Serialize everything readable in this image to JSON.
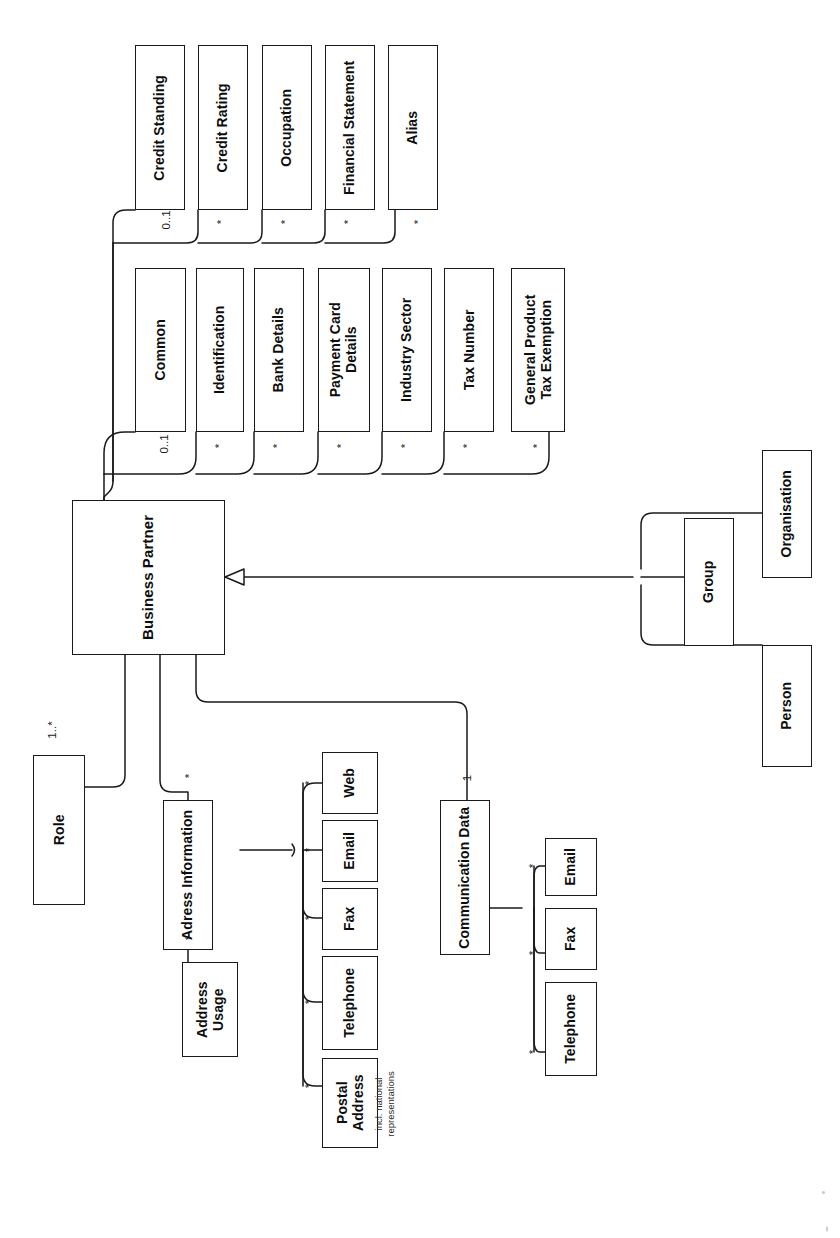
{
  "diagram": {
    "title": "Business Partner",
    "type": "uml-class-diagram",
    "orientation": "rotated-90-ccw",
    "stroke_color": "#1a1a1a",
    "background_color": "#ffffff"
  },
  "nodes": {
    "business_partner": {
      "label": "Business Partner",
      "font_size": 15
    },
    "credit_standing": {
      "label": "Credit Standing",
      "font_size": 14
    },
    "credit_rating": {
      "label": "Credit Rating",
      "font_size": 14
    },
    "occupation": {
      "label": "Occupation",
      "font_size": 14
    },
    "financial_statement": {
      "label": "Financial Statement",
      "font_size": 14
    },
    "alias": {
      "label": "Alias",
      "font_size": 14
    },
    "common": {
      "label": "Common",
      "font_size": 14
    },
    "identification": {
      "label": "Identification",
      "font_size": 14
    },
    "bank_details": {
      "label": "Bank Details",
      "font_size": 14
    },
    "payment_card_details": {
      "label": "Payment Card\nDetails",
      "font_size": 14
    },
    "industry_sector": {
      "label": "Industry Sector",
      "font_size": 14
    },
    "tax_number": {
      "label": "Tax Number",
      "font_size": 14
    },
    "general_product_tax_exemption": {
      "label": "General Product\nTax Exemption",
      "font_size": 14
    },
    "person": {
      "label": "Person",
      "font_size": 14
    },
    "group": {
      "label": "Group",
      "font_size": 14
    },
    "organisation": {
      "label": "Organisation",
      "font_size": 14
    },
    "role": {
      "label": "Role",
      "font_size": 14
    },
    "adress_information": {
      "label": "Adress Information",
      "font_size": 14
    },
    "address_usage": {
      "label": "Address\nUsage",
      "font_size": 14
    },
    "postal_address": {
      "label": "Postal\nAddress",
      "font_size": 14
    },
    "telephone_addr": {
      "label": "Telephone",
      "font_size": 14
    },
    "fax_addr": {
      "label": "Fax",
      "font_size": 14
    },
    "email_addr": {
      "label": "Email",
      "font_size": 14
    },
    "web_addr": {
      "label": "Web",
      "font_size": 14
    },
    "communication_data": {
      "label": "Communication Data",
      "font_size": 14
    },
    "telephone_comm": {
      "label": "Telephone",
      "font_size": 14
    },
    "fax_comm": {
      "label": "Fax",
      "font_size": 14
    },
    "email_comm": {
      "label": "Email",
      "font_size": 14
    }
  },
  "multiplicities": {
    "credit_standing": "0..1",
    "credit_rating": "*",
    "occupation": "*",
    "financial_statement": "*",
    "alias": "*",
    "common": "0..1",
    "identification": "*",
    "bank_details": "*",
    "payment_card_details": "*",
    "industry_sector": "*",
    "tax_number": "*",
    "general_product_tax_exemption": "*",
    "role": "1..*",
    "adress_information": "*",
    "address_usage": "*",
    "postal_address": "*",
    "telephone_addr": "*",
    "fax_addr": "*",
    "email_addr": "*",
    "web_addr": "*",
    "communication_data": "1",
    "telephone_comm": "*",
    "fax_comm": "*",
    "email_comm": "*"
  },
  "annotations": {
    "postal_address_note": "incl. national\nrepresentations"
  }
}
